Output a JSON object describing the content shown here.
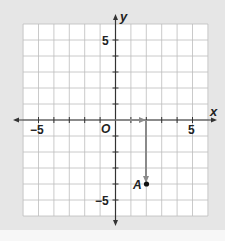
{
  "diagram": {
    "type": "coordinate-plane",
    "axes": {
      "x_label": "x",
      "y_label": "y",
      "origin_label": "O",
      "range": {
        "xmin": -6,
        "xmax": 6,
        "ymin": -6,
        "ymax": 6
      },
      "tick_labels": {
        "x_neg": "−5",
        "x_pos": "5",
        "y_pos": "5",
        "y_neg": "−5"
      }
    },
    "point": {
      "label": "A",
      "x": 2,
      "y": -4
    },
    "path_arrows": [
      {
        "from": [
          0,
          0
        ],
        "to": [
          2,
          0
        ],
        "description": "move right 2"
      },
      {
        "from": [
          2,
          0
        ],
        "to": [
          2,
          -4
        ],
        "description": "move down 4"
      }
    ],
    "colors": {
      "background": "#e6e6e6",
      "grid_fill": "#ffffff",
      "grid_line": "#b9b9b9",
      "axis": "#333333",
      "arrow": "#8a8a8a",
      "point": "#111111"
    }
  }
}
